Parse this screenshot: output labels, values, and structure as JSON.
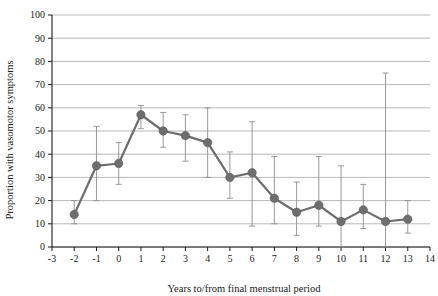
{
  "chart_data": {
    "type": "line",
    "title": "",
    "xlabel": "Years to/from final menstrual period",
    "ylabel": "Proportion with vasomotor symptoms",
    "xlim": [
      -3,
      14
    ],
    "ylim": [
      0,
      100
    ],
    "xticks": [
      -3,
      -2,
      -1,
      0,
      1,
      2,
      3,
      4,
      5,
      6,
      7,
      8,
      9,
      10,
      11,
      12,
      13,
      14
    ],
    "yticks": [
      0,
      10,
      20,
      30,
      40,
      50,
      60,
      70,
      80,
      90,
      100
    ],
    "grid": "horizontal",
    "legend": "none",
    "marker": "filled-circle",
    "error_bars": "vertical-capped",
    "series": [
      {
        "name": "Proportion with vasomotor symptoms",
        "color": "#6e6e6e",
        "x": [
          -2,
          -1,
          0,
          1,
          2,
          3,
          4,
          5,
          6,
          7,
          8,
          9,
          10,
          11,
          12,
          13
        ],
        "values": [
          14,
          35,
          36,
          57,
          50,
          48,
          45,
          30,
          32,
          21,
          15,
          18,
          11,
          16,
          11,
          12
        ],
        "error_low": [
          10,
          20,
          27,
          51,
          43,
          37,
          30,
          21,
          9,
          10,
          5,
          9,
          0,
          8,
          0,
          6
        ],
        "error_high": [
          20,
          52,
          45,
          61,
          58,
          57,
          60,
          41,
          54,
          39,
          28,
          39,
          35,
          27,
          75,
          20
        ]
      }
    ]
  },
  "axes": {
    "x_tick_labels": [
      "-3",
      "-2",
      "-1",
      "0",
      "1",
      "2",
      "3",
      "4",
      "5",
      "6",
      "7",
      "8",
      "9",
      "10",
      "11",
      "12",
      "13",
      "14"
    ],
    "y_tick_labels": [
      "0",
      "10",
      "20",
      "30",
      "40",
      "50",
      "60",
      "70",
      "80",
      "90",
      "100"
    ],
    "x_title": "Years to/from final menstrual period",
    "y_title": "Proportion with vasomotor symptoms"
  },
  "colors": {
    "series": "#6e6e6e",
    "gridline": "#9a9a9a",
    "axis": "#1a1a1a",
    "errorbar": "#8d8d8d",
    "background": "#ffffff"
  },
  "caption": {
    "partial_text": ""
  }
}
